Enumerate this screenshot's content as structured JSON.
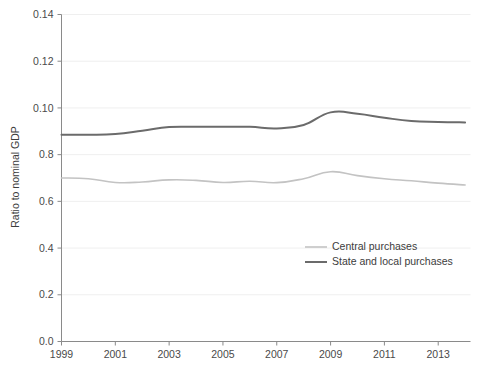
{
  "chart_data": {
    "type": "line",
    "title": "",
    "subtitle": "",
    "xlabel": "",
    "ylabel": "Ratio to nominal GDP",
    "xlim": [
      1999,
      2014.2
    ],
    "ylim": [
      0.0,
      0.14
    ],
    "grid": true,
    "legend_position": "center-right",
    "x_tick_labels": [
      "1999",
      "2001",
      "2003",
      "2005",
      "2007",
      "2009",
      "2011",
      "2013"
    ],
    "x_ticks": [
      1999,
      2001,
      2003,
      2005,
      2007,
      2009,
      2011,
      2013
    ],
    "y_tick_labels": [
      "0.14",
      "0.12",
      "0.10",
      "0.8",
      "0.6",
      "0.4",
      "0.2",
      "0.0"
    ],
    "y_ticks": [
      0.14,
      0.12,
      0.1,
      0.08,
      0.06,
      0.04,
      0.02,
      0.0
    ],
    "x": [
      1999,
      2000,
      2001,
      2002,
      2003,
      2004,
      2005,
      2006,
      2007,
      2008,
      2009,
      2010,
      2011,
      2012,
      2013,
      2014
    ],
    "series": [
      {
        "name": "Central purchases",
        "color": "#c3c3c3",
        "width": 1.6,
        "values": [
          0.07,
          0.0697,
          0.0681,
          0.0683,
          0.0692,
          0.069,
          0.0681,
          0.0686,
          0.068,
          0.0697,
          0.0727,
          0.071,
          0.0697,
          0.0688,
          0.0678,
          0.067
        ]
      },
      {
        "name": "State and local purchases",
        "color": "#6b6b6b",
        "width": 2.0,
        "values": [
          0.0885,
          0.0885,
          0.0888,
          0.0902,
          0.0918,
          0.0919,
          0.0919,
          0.0919,
          0.0912,
          0.0927,
          0.0981,
          0.0975,
          0.0958,
          0.0944,
          0.094,
          0.0938
        ]
      }
    ]
  },
  "legend": {
    "entries": [
      {
        "label": "Central purchases"
      },
      {
        "label": "State and local purchases"
      }
    ]
  }
}
